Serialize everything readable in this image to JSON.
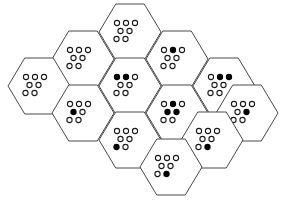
{
  "figure": {
    "type": "hexagonal-cell-diagram",
    "cell_count": 13,
    "dots_per_cell": 7,
    "dot_rows": [
      3,
      2,
      2
    ],
    "colors": {
      "background": "#ffffff",
      "hex_stroke": "#4a4a4a",
      "dot_stroke": "#1a1a1a",
      "dot_open_fill": "#ffffff",
      "dot_filled_fill": "#000000"
    },
    "geometry": {
      "hex_width": 62,
      "hex_height": 56,
      "hex_side": 18,
      "dot_radius": 2.6,
      "dot_spacing_x": 9,
      "dot_spacing_y": 8
    },
    "totals": {
      "total_dots": 91,
      "filled_dots": 12,
      "open_dots": 79
    },
    "cells": [
      {
        "id": "cell-top-center",
        "label": "top center",
        "cx": 130,
        "cy": 32,
        "filled_count": 0,
        "dots": [
          {
            "row": 0,
            "col": 0,
            "state": "open"
          },
          {
            "row": 0,
            "col": 1,
            "state": "open"
          },
          {
            "row": 0,
            "col": 2,
            "state": "open"
          },
          {
            "row": 1,
            "col": 0,
            "state": "open"
          },
          {
            "row": 1,
            "col": 1,
            "state": "open"
          },
          {
            "row": 2,
            "col": 0,
            "state": "open"
          },
          {
            "row": 2,
            "col": 1,
            "state": "open"
          }
        ]
      },
      {
        "id": "cell-upper-left",
        "label": "upper left",
        "cx": 83,
        "cy": 59,
        "filled_count": 0,
        "dots": [
          {
            "row": 0,
            "col": 0,
            "state": "open"
          },
          {
            "row": 0,
            "col": 1,
            "state": "open"
          },
          {
            "row": 0,
            "col": 2,
            "state": "open"
          },
          {
            "row": 1,
            "col": 0,
            "state": "open"
          },
          {
            "row": 1,
            "col": 1,
            "state": "open"
          },
          {
            "row": 2,
            "col": 0,
            "state": "open"
          },
          {
            "row": 2,
            "col": 1,
            "state": "open"
          }
        ]
      },
      {
        "id": "cell-upper-right",
        "label": "upper right",
        "cx": 177,
        "cy": 59,
        "filled_count": 1,
        "dots": [
          {
            "row": 0,
            "col": 0,
            "state": "open"
          },
          {
            "row": 0,
            "col": 1,
            "state": "filled"
          },
          {
            "row": 0,
            "col": 2,
            "state": "open"
          },
          {
            "row": 1,
            "col": 0,
            "state": "open"
          },
          {
            "row": 1,
            "col": 1,
            "state": "open"
          },
          {
            "row": 2,
            "col": 0,
            "state": "open"
          },
          {
            "row": 2,
            "col": 1,
            "state": "open"
          }
        ]
      },
      {
        "id": "cell-far-left",
        "label": "far left",
        "cx": 39,
        "cy": 86,
        "filled_count": 0,
        "dots": [
          {
            "row": 0,
            "col": 0,
            "state": "open"
          },
          {
            "row": 0,
            "col": 1,
            "state": "open"
          },
          {
            "row": 0,
            "col": 2,
            "state": "open"
          },
          {
            "row": 1,
            "col": 0,
            "state": "open"
          },
          {
            "row": 1,
            "col": 1,
            "state": "open"
          },
          {
            "row": 2,
            "col": 0,
            "state": "open"
          },
          {
            "row": 2,
            "col": 1,
            "state": "open"
          }
        ]
      },
      {
        "id": "cell-mid-left-upper",
        "label": "middle left upper",
        "cx": 130,
        "cy": 86,
        "filled_count": 2,
        "dots": [
          {
            "row": 0,
            "col": 0,
            "state": "filled"
          },
          {
            "row": 0,
            "col": 1,
            "state": "filled"
          },
          {
            "row": 0,
            "col": 2,
            "state": "open"
          },
          {
            "row": 1,
            "col": 0,
            "state": "open"
          },
          {
            "row": 1,
            "col": 1,
            "state": "open"
          },
          {
            "row": 2,
            "col": 0,
            "state": "open"
          },
          {
            "row": 2,
            "col": 1,
            "state": "open"
          }
        ]
      },
      {
        "id": "cell-mid-right-upper",
        "label": "middle right upper",
        "cx": 224,
        "cy": 86,
        "filled_count": 2,
        "dots": [
          {
            "row": 0,
            "col": 0,
            "state": "open"
          },
          {
            "row": 0,
            "col": 1,
            "state": "filled"
          },
          {
            "row": 0,
            "col": 2,
            "state": "filled"
          },
          {
            "row": 1,
            "col": 0,
            "state": "open"
          },
          {
            "row": 1,
            "col": 1,
            "state": "open"
          },
          {
            "row": 2,
            "col": 0,
            "state": "open"
          },
          {
            "row": 2,
            "col": 1,
            "state": "open"
          }
        ]
      },
      {
        "id": "cell-left-center",
        "label": "left center",
        "cx": 83,
        "cy": 113,
        "filled_count": 1,
        "dots": [
          {
            "row": 0,
            "col": 0,
            "state": "open"
          },
          {
            "row": 0,
            "col": 1,
            "state": "open"
          },
          {
            "row": 0,
            "col": 2,
            "state": "open"
          },
          {
            "row": 1,
            "col": 0,
            "state": "filled"
          },
          {
            "row": 1,
            "col": 1,
            "state": "open"
          },
          {
            "row": 2,
            "col": 0,
            "state": "open"
          },
          {
            "row": 2,
            "col": 1,
            "state": "open"
          }
        ]
      },
      {
        "id": "cell-center",
        "label": "center",
        "cx": 177,
        "cy": 113,
        "filled_count": 3,
        "dots": [
          {
            "row": 0,
            "col": 0,
            "state": "open"
          },
          {
            "row": 0,
            "col": 1,
            "state": "filled"
          },
          {
            "row": 0,
            "col": 2,
            "state": "open"
          },
          {
            "row": 1,
            "col": 0,
            "state": "filled"
          },
          {
            "row": 1,
            "col": 1,
            "state": "filled"
          },
          {
            "row": 2,
            "col": 0,
            "state": "open"
          },
          {
            "row": 2,
            "col": 1,
            "state": "open"
          }
        ]
      },
      {
        "id": "cell-far-right",
        "label": "far right",
        "cx": 247,
        "cy": 113,
        "filled_count": 1,
        "dots": [
          {
            "row": 0,
            "col": 0,
            "state": "open"
          },
          {
            "row": 0,
            "col": 1,
            "state": "open"
          },
          {
            "row": 0,
            "col": 2,
            "state": "open"
          },
          {
            "row": 1,
            "col": 0,
            "state": "open"
          },
          {
            "row": 1,
            "col": 1,
            "state": "filled"
          },
          {
            "row": 2,
            "col": 0,
            "state": "open"
          },
          {
            "row": 2,
            "col": 1,
            "state": "open"
          }
        ]
      },
      {
        "id": "cell-lower-left",
        "label": "lower left",
        "cx": 130,
        "cy": 140,
        "filled_count": 1,
        "dots": [
          {
            "row": 0,
            "col": 0,
            "state": "open"
          },
          {
            "row": 0,
            "col": 1,
            "state": "open"
          },
          {
            "row": 0,
            "col": 2,
            "state": "open"
          },
          {
            "row": 1,
            "col": 0,
            "state": "open"
          },
          {
            "row": 1,
            "col": 1,
            "state": "open"
          },
          {
            "row": 2,
            "col": 0,
            "state": "filled"
          },
          {
            "row": 2,
            "col": 1,
            "state": "open"
          }
        ]
      },
      {
        "id": "cell-lower-right",
        "label": "lower right",
        "cx": 212,
        "cy": 140,
        "filled_count": 1,
        "dots": [
          {
            "row": 0,
            "col": 0,
            "state": "open"
          },
          {
            "row": 0,
            "col": 1,
            "state": "open"
          },
          {
            "row": 0,
            "col": 2,
            "state": "open"
          },
          {
            "row": 1,
            "col": 0,
            "state": "open"
          },
          {
            "row": 1,
            "col": 1,
            "state": "open"
          },
          {
            "row": 2,
            "col": 0,
            "state": "open"
          },
          {
            "row": 2,
            "col": 1,
            "state": "filled"
          }
        ]
      },
      {
        "id": "cell-bottom-center",
        "label": "bottom center",
        "cx": 171,
        "cy": 167,
        "filled_count": 1,
        "dots": [
          {
            "row": 0,
            "col": 0,
            "state": "open"
          },
          {
            "row": 0,
            "col": 1,
            "state": "open"
          },
          {
            "row": 0,
            "col": 2,
            "state": "open"
          },
          {
            "row": 1,
            "col": 0,
            "state": "open"
          },
          {
            "row": 1,
            "col": 1,
            "state": "open"
          },
          {
            "row": 2,
            "col": 0,
            "state": "open"
          },
          {
            "row": 2,
            "col": 1,
            "state": "filled"
          }
        ]
      },
      {
        "id": "cell-upper-left-outer",
        "label": "upper left outer",
        "cx": 130,
        "cy": 32,
        "hidden": true,
        "filled_count": 0,
        "dots": []
      }
    ]
  }
}
